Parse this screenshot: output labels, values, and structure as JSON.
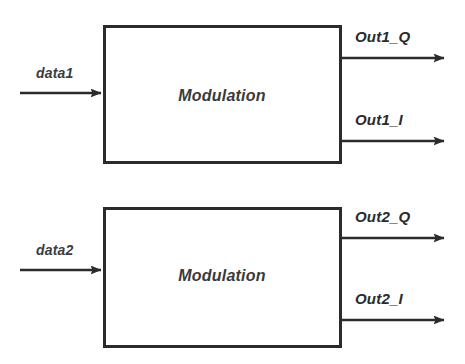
{
  "diagram": {
    "colors": {
      "stroke": "#2b2b2b",
      "box_fill": "#ffffff",
      "background": "#ffffff",
      "text": "#3a3a3a"
    },
    "blocks": [
      {
        "id": "modulation-1",
        "label": "Modulation",
        "input": {
          "label": "data1",
          "name": "input-signal-data1"
        },
        "outputs": [
          {
            "label": "Out1_Q",
            "name": "output-signal-out1-q"
          },
          {
            "label": "Out1_I",
            "name": "output-signal-out1-i"
          }
        ]
      },
      {
        "id": "modulation-2",
        "label": "Modulation",
        "input": {
          "label": "data2",
          "name": "input-signal-data2"
        },
        "outputs": [
          {
            "label": "Out2_Q",
            "name": "output-signal-out2-q"
          },
          {
            "label": "Out2_I",
            "name": "output-signal-out2-i"
          }
        ]
      }
    ]
  }
}
